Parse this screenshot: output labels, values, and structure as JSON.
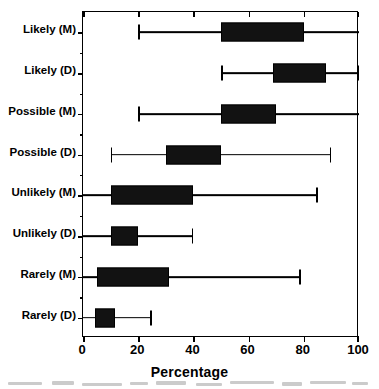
{
  "chart_data": {
    "type": "bar",
    "subtype": "horizontal-box-plot",
    "title": "",
    "xlabel": "Percentage",
    "ylabel": "",
    "xlim": [
      0,
      100
    ],
    "xticks": [
      0,
      20,
      40,
      60,
      80,
      100
    ],
    "xticklabels": [
      "0",
      "20",
      "40",
      "60",
      "80",
      "100"
    ],
    "grid": false,
    "legend": "none",
    "orientation": "horizontal",
    "categories": [
      "Likely (M)",
      "Likely (D)",
      "Possible (M)",
      "Possible (D)",
      "Unlikely (M)",
      "Unlikely (D)",
      "Rarely (M)",
      "Rarely (D)"
    ],
    "boxes": [
      {
        "label": "Likely (M)",
        "whisker_low": 20,
        "q1": 50,
        "q3": 80,
        "whisker_high": 100,
        "cap_low": true,
        "cap_high": false
      },
      {
        "label": "Likely (D)",
        "whisker_low": 50,
        "q1": 69,
        "q3": 88,
        "whisker_high": 100,
        "cap_low": true,
        "cap_high": true
      },
      {
        "label": "Possible (M)",
        "whisker_low": 20,
        "q1": 50,
        "q3": 70,
        "whisker_high": 100,
        "cap_low": true,
        "cap_high": false
      },
      {
        "label": "Possible (D)",
        "whisker_low": 10,
        "q1": 30,
        "q3": 50,
        "whisker_high": 90,
        "cap_low": true,
        "cap_high": true
      },
      {
        "label": "Unlikely (M)",
        "whisker_low": 0,
        "q1": 10,
        "q3": 40,
        "whisker_high": 85,
        "cap_low": false,
        "cap_high": true
      },
      {
        "label": "Unlikely (D)",
        "whisker_low": 0,
        "q1": 10,
        "q3": 20,
        "whisker_high": 40,
        "cap_low": false,
        "cap_high": true
      },
      {
        "label": "Rarely (M)",
        "whisker_low": 0,
        "q1": 5,
        "q3": 31,
        "whisker_high": 79,
        "cap_low": false,
        "cap_high": true
      },
      {
        "label": "Rarely (D)",
        "whisker_low": 0,
        "q1": 4.3,
        "q3": 11.5,
        "whisker_high": 25,
        "cap_low": false,
        "cap_high": true
      }
    ],
    "colors": {
      "box_fill": "#121212",
      "line": "#000000",
      "background": "#ffffff"
    }
  }
}
